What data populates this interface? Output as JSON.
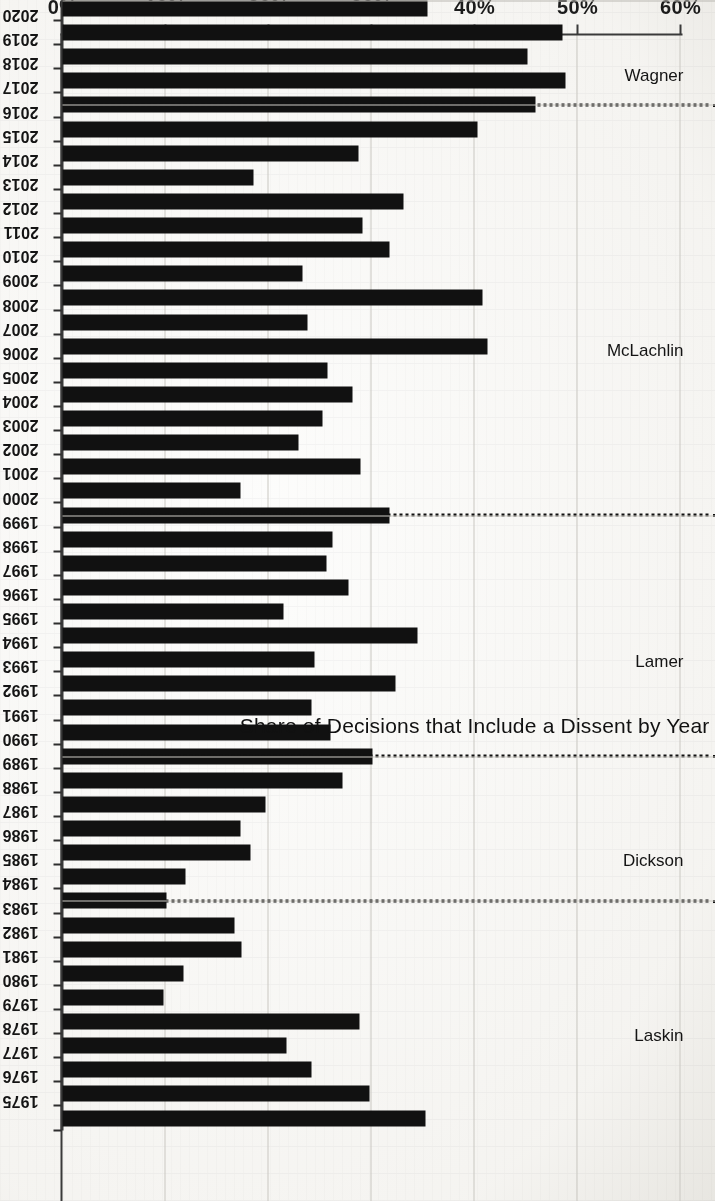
{
  "chart_data": {
    "type": "bar",
    "orientation": "horizontal-rotated",
    "title": "Share of Decisions that Include a Dissent by Year",
    "xlabel": "",
    "ylabel": "",
    "ylim": [
      0,
      60
    ],
    "grid": true,
    "legend": "none",
    "value_axis_ticks": [
      "0%",
      "10%",
      "20%",
      "30%",
      "40%",
      "50%",
      "60%"
    ],
    "value_axis_tick_values": [
      0,
      10,
      20,
      30,
      40,
      50,
      60
    ],
    "categories": [
      "2021",
      "2020",
      "2019",
      "2018",
      "2017",
      "2016",
      "2015",
      "2014",
      "2013",
      "2012",
      "2011",
      "2010",
      "2009",
      "2008",
      "2007",
      "2006",
      "2005",
      "2004",
      "2003",
      "2002",
      "2001",
      "2000",
      "1999",
      "1998",
      "1997",
      "1996",
      "1995",
      "1994",
      "1993",
      "1992",
      "1991",
      "1990",
      "1989",
      "1988",
      "1987",
      "1986",
      "1985",
      "1984",
      "1983",
      "1982",
      "1981",
      "1980",
      "1979",
      "1978",
      "1977",
      "1976",
      "1975"
    ],
    "values": [
      35.4,
      48.5,
      45.1,
      48.8,
      45.9,
      40.3,
      28.7,
      18.5,
      33.1,
      29.1,
      31.7,
      23.3,
      40.8,
      23.8,
      41.3,
      25.7,
      28.2,
      25.2,
      22.9,
      28.9,
      17.3,
      31.7,
      26.2,
      25.6,
      27.8,
      21.5,
      34.5,
      24.5,
      32.3,
      24.2,
      26.0,
      30.1,
      27.2,
      19.7,
      17.3,
      18.3,
      11.9,
      10.1,
      16.7,
      17.4,
      11.7,
      9.8,
      28.8,
      21.7,
      24.2,
      29.8,
      35.2
    ],
    "annotations": {
      "era_groups": [
        {
          "name": "Wagner",
          "start_year": "2017",
          "end_year": "2021"
        },
        {
          "name": "McLachlin",
          "start_year": "2000",
          "end_year": "2016"
        },
        {
          "name": "Lamer",
          "start_year": "1990",
          "end_year": "1999"
        },
        {
          "name": "Dickson",
          "start_year": "1984",
          "end_year": "1989"
        },
        {
          "name": "Laskin",
          "start_year": "1975",
          "end_year": "1983"
        }
      ],
      "separator_style": "dotted",
      "separator_at_years": [
        "2017",
        "2000",
        "1990",
        "1984"
      ]
    },
    "colors": {
      "bar": "#111111",
      "grid": "#c9c7c2",
      "axis": "#3a3a3a",
      "separator": "#111111",
      "background": "#fdfdfc"
    }
  }
}
